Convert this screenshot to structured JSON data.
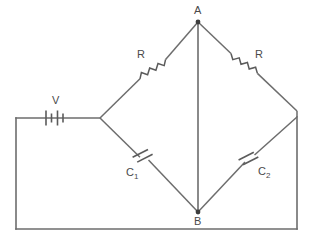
{
  "figure": {
    "background_color": "#ffffff",
    "wire_color": "#6d6d6d",
    "label_color": "#4a4a4a",
    "node_color": "#3d3d3d",
    "width": 311,
    "height": 242
  },
  "labels": {
    "node_a": "A",
    "node_b": "B",
    "source": "V",
    "resistor_left": "R",
    "resistor_right": "R",
    "capacitor_left_main": "C",
    "capacitor_left_sub": "1",
    "capacitor_right_main": "C",
    "capacitor_right_sub": "2"
  },
  "components": [
    {
      "id": "battery",
      "type": "battery-cell-symbol",
      "label": "V",
      "position": {
        "x": 56,
        "y": 118
      },
      "orientation": "horizontal"
    },
    {
      "id": "resistor-left",
      "type": "resistor-zigzag",
      "label": "R",
      "position": {
        "x": 152,
        "y": 68
      },
      "orientation": "diagonal-up-right"
    },
    {
      "id": "resistor-right",
      "type": "resistor-zigzag",
      "label": "R",
      "position": {
        "x": 247,
        "y": 68
      },
      "orientation": "diagonal-down-right"
    },
    {
      "id": "capacitor-left",
      "type": "capacitor-parallel-plates",
      "label": "C1",
      "position": {
        "x": 145,
        "y": 160
      },
      "orientation": "diagonal-down-right"
    },
    {
      "id": "capacitor-right",
      "type": "capacitor-parallel-plates",
      "label": "C2",
      "position": {
        "x": 250,
        "y": 159
      },
      "orientation": "diagonal-up-right"
    }
  ],
  "nodes": [
    {
      "id": "A",
      "label": "A",
      "x": 198,
      "y": 22
    },
    {
      "id": "B",
      "label": "B",
      "x": 198,
      "y": 212
    },
    {
      "id": "left-vertex",
      "label": "",
      "x": 100,
      "y": 118
    },
    {
      "id": "right-vertex",
      "label": "",
      "x": 297,
      "y": 117
    }
  ],
  "geometry": {
    "outer_loop": "M100,118 L16,118 L16,229 L297,229 L297,117",
    "bridge_ua_left": "M100,118 L198,22",
    "bridge_ua_right": "M198,22 L297,117",
    "bridge_lo_left": "M100,118 L198,212",
    "bridge_lo_right": "M198,212 L297,117",
    "bridge_middle": "M198,22 L198,212"
  }
}
